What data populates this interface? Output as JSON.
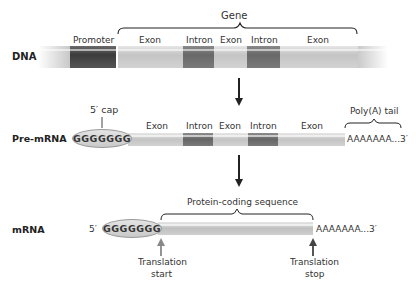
{
  "colors": {
    "background": "#ffffff",
    "exon": "#c8c8c8",
    "intron": "#707070",
    "promoter": "#4a4a4a",
    "cap": "#d6d6d6",
    "arrow": "#222222",
    "translation_start_arrow": "#888888",
    "translation_stop_arrow": "#444444"
  },
  "dna": {
    "row_label": "DNA",
    "gene_label": "Gene",
    "segments": [
      {
        "label": "Promoter",
        "type": "promoter"
      },
      {
        "label": "Exon",
        "type": "exon"
      },
      {
        "label": "Intron",
        "type": "intron"
      },
      {
        "label": "Exon",
        "type": "exon"
      },
      {
        "label": "Intron",
        "type": "intron"
      },
      {
        "label": "Exon",
        "type": "exon"
      }
    ]
  },
  "pre_mrna": {
    "row_label": "Pre-mRNA",
    "cap_label": "5′ cap",
    "cap_sequence": "GGGGGGG",
    "segments": [
      {
        "label": "Exon",
        "type": "exon"
      },
      {
        "label": "Intron",
        "type": "intron"
      },
      {
        "label": "Exon",
        "type": "exon"
      },
      {
        "label": "Intron",
        "type": "intron"
      },
      {
        "label": "Exon",
        "type": "exon"
      }
    ],
    "poly_a_label": "Poly(A) tail",
    "poly_a_sequence": "AAAAAAA...3′"
  },
  "mrna": {
    "row_label": "mRNA",
    "five_prime": "5′",
    "cap_sequence": "GGGGGGG",
    "coding_label": "Protein-coding sequence",
    "poly_a_sequence": "AAAAAAA...3′",
    "translation_start": [
      "Translation",
      "start"
    ],
    "translation_stop": [
      "Translation",
      "stop"
    ]
  }
}
